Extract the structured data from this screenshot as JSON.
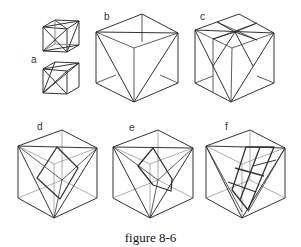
{
  "figure": {
    "caption": "figure 8-6",
    "panels": [
      {
        "id": "a",
        "label": "a",
        "description": "two small cubes with inscribed triangles (two variants)"
      },
      {
        "id": "b",
        "label": "b",
        "description": "cube with inscribed large triangle (face diagonals)"
      },
      {
        "id": "c",
        "label": "c",
        "description": "cube with triangle and subdivided top face"
      },
      {
        "id": "d",
        "label": "d",
        "description": "cube with inscribed tetrahedron and inner square"
      },
      {
        "id": "e",
        "label": "e",
        "description": "cube with inscribed tetrahedron and inner skewed quadrilateral"
      },
      {
        "id": "f",
        "label": "f",
        "description": "cube with inscribed tetrahedron and inner grid of quadrilaterals"
      }
    ],
    "line_color": "#333333"
  }
}
